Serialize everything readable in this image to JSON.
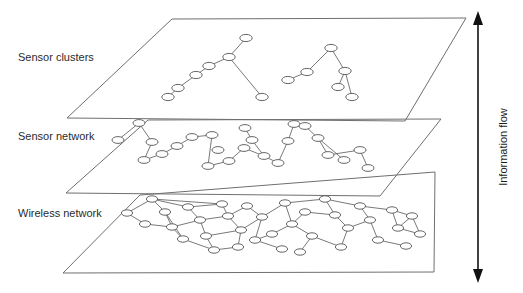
{
  "figure": {
    "type": "layered-network-diagram",
    "background_color": "#ffffff",
    "line_color": "#6a6a6a",
    "node_fill": "#ffffff",
    "text_color": "#2b2b2b",
    "layers": [
      {
        "id": "sensor-clusters",
        "label": "Sensor clusters",
        "label_x": 18,
        "label_y": 61,
        "plane": "172,19 466,18 405,121 67,118",
        "description": "two small cluster trees of sensor nodes"
      },
      {
        "id": "sensor-network",
        "label": "Sensor network",
        "label_x": 18,
        "label_y": 140,
        "plane": "148,120 441,119 380,196 66,193",
        "description": "sparse tree-like sensor network with hub nodes"
      },
      {
        "id": "wireless-network",
        "label": "Wireless network",
        "label_x": 18,
        "label_y": 217,
        "plane": "140,195 435,172 434,272 63,273",
        "description": "dense meshed wireless network"
      }
    ],
    "flow_arrow": {
      "label": "Information flow",
      "label_x": 505,
      "label_y": 146,
      "orientation": "vertical-double-headed",
      "x": 478,
      "y_top": 12,
      "y_bottom": 282
    },
    "clusters_nodes": [
      [
        246,
        38
      ],
      [
        229,
        57
      ],
      [
        209,
        66
      ],
      [
        196,
        75
      ],
      [
        178,
        88
      ],
      [
        168,
        97
      ],
      [
        262,
        97
      ],
      [
        331,
        48
      ],
      [
        307,
        72
      ],
      [
        288,
        80
      ],
      [
        345,
        71
      ],
      [
        338,
        87
      ],
      [
        352,
        97
      ]
    ],
    "clusters_links": [
      [
        246,
        38,
        229,
        57
      ],
      [
        229,
        57,
        209,
        66
      ],
      [
        209,
        66,
        196,
        75
      ],
      [
        196,
        75,
        178,
        88
      ],
      [
        178,
        88,
        168,
        97
      ],
      [
        229,
        57,
        262,
        97
      ],
      [
        331,
        48,
        307,
        72
      ],
      [
        307,
        72,
        288,
        80
      ],
      [
        331,
        48,
        345,
        71
      ],
      [
        345,
        71,
        338,
        87
      ],
      [
        345,
        71,
        352,
        97
      ]
    ],
    "sensor_nodes": [
      [
        139,
        123
      ],
      [
        118,
        140
      ],
      [
        152,
        142
      ],
      [
        144,
        160
      ],
      [
        162,
        154
      ],
      [
        177,
        146
      ],
      [
        192,
        137
      ],
      [
        212,
        135
      ],
      [
        218,
        150
      ],
      [
        208,
        166
      ],
      [
        229,
        161
      ],
      [
        244,
        148
      ],
      [
        245,
        128
      ],
      [
        252,
        140
      ],
      [
        264,
        156
      ],
      [
        278,
        163
      ],
      [
        288,
        141
      ],
      [
        294,
        124
      ],
      [
        305,
        126
      ],
      [
        318,
        138
      ],
      [
        328,
        155
      ],
      [
        344,
        160
      ],
      [
        360,
        150
      ],
      [
        368,
        168
      ]
    ],
    "sensor_links": [
      [
        139,
        123,
        118,
        140
      ],
      [
        139,
        123,
        152,
        142
      ],
      [
        152,
        142,
        144,
        160
      ],
      [
        144,
        160,
        162,
        154
      ],
      [
        162,
        154,
        177,
        146
      ],
      [
        177,
        146,
        192,
        137
      ],
      [
        192,
        137,
        212,
        135
      ],
      [
        212,
        135,
        208,
        166
      ],
      [
        208,
        166,
        229,
        161
      ],
      [
        229,
        161,
        244,
        148
      ],
      [
        244,
        148,
        264,
        156
      ],
      [
        264,
        156,
        278,
        163
      ],
      [
        245,
        128,
        252,
        140
      ],
      [
        252,
        140,
        264,
        156
      ],
      [
        294,
        124,
        305,
        126
      ],
      [
        305,
        126,
        318,
        138
      ],
      [
        318,
        138,
        328,
        155
      ],
      [
        318,
        138,
        344,
        160
      ],
      [
        328,
        155,
        360,
        150
      ],
      [
        360,
        150,
        368,
        168
      ],
      [
        288,
        141,
        278,
        163
      ],
      [
        288,
        141,
        294,
        124
      ]
    ],
    "wireless_nodes": [
      [
        152,
        199
      ],
      [
        127,
        213
      ],
      [
        165,
        212
      ],
      [
        172,
        227
      ],
      [
        145,
        224
      ],
      [
        188,
        207
      ],
      [
        200,
        220
      ],
      [
        183,
        239
      ],
      [
        206,
        236
      ],
      [
        222,
        204
      ],
      [
        228,
        216
      ],
      [
        241,
        230
      ],
      [
        247,
        206
      ],
      [
        262,
        217
      ],
      [
        255,
        240
      ],
      [
        272,
        234
      ],
      [
        238,
        247
      ],
      [
        214,
        250
      ],
      [
        285,
        203
      ],
      [
        292,
        224
      ],
      [
        305,
        212
      ],
      [
        312,
        236
      ],
      [
        282,
        249
      ],
      [
        300,
        252
      ],
      [
        325,
        199
      ],
      [
        335,
        215
      ],
      [
        348,
        228
      ],
      [
        341,
        247
      ],
      [
        360,
        206
      ],
      [
        370,
        220
      ],
      [
        378,
        240
      ],
      [
        392,
        210
      ],
      [
        398,
        228
      ],
      [
        406,
        246
      ],
      [
        412,
        216
      ],
      [
        420,
        234
      ]
    ],
    "wireless_links": [
      [
        152,
        199,
        127,
        213
      ],
      [
        152,
        199,
        165,
        212
      ],
      [
        152,
        199,
        188,
        207
      ],
      [
        127,
        213,
        145,
        224
      ],
      [
        145,
        224,
        172,
        227
      ],
      [
        165,
        212,
        172,
        227
      ],
      [
        165,
        212,
        183,
        239
      ],
      [
        172,
        227,
        200,
        220
      ],
      [
        172,
        227,
        183,
        239
      ],
      [
        183,
        239,
        214,
        250
      ],
      [
        188,
        207,
        200,
        220
      ],
      [
        188,
        207,
        222,
        204
      ],
      [
        200,
        220,
        206,
        236
      ],
      [
        200,
        220,
        228,
        216
      ],
      [
        206,
        236,
        214,
        250
      ],
      [
        206,
        236,
        241,
        230
      ],
      [
        222,
        204,
        228,
        216
      ],
      [
        228,
        216,
        241,
        230
      ],
      [
        228,
        216,
        247,
        206
      ],
      [
        241,
        230,
        238,
        247
      ],
      [
        241,
        230,
        262,
        217
      ],
      [
        247,
        206,
        262,
        217
      ],
      [
        262,
        217,
        255,
        240
      ],
      [
        262,
        217,
        285,
        203
      ],
      [
        255,
        240,
        272,
        234
      ],
      [
        255,
        240,
        282,
        249
      ],
      [
        272,
        234,
        292,
        224
      ],
      [
        285,
        203,
        292,
        224
      ],
      [
        285,
        203,
        325,
        199
      ],
      [
        292,
        224,
        305,
        212
      ],
      [
        292,
        224,
        312,
        236
      ],
      [
        305,
        212,
        335,
        215
      ],
      [
        312,
        236,
        300,
        252
      ],
      [
        312,
        236,
        341,
        247
      ],
      [
        325,
        199,
        335,
        215
      ],
      [
        335,
        215,
        348,
        228
      ],
      [
        348,
        228,
        341,
        247
      ],
      [
        348,
        228,
        370,
        220
      ],
      [
        360,
        206,
        370,
        220
      ],
      [
        360,
        206,
        392,
        210
      ],
      [
        370,
        220,
        378,
        240
      ],
      [
        378,
        240,
        406,
        246
      ],
      [
        392,
        210,
        398,
        228
      ],
      [
        398,
        228,
        412,
        216
      ],
      [
        398,
        228,
        420,
        234
      ],
      [
        412,
        216,
        420,
        234
      ],
      [
        325,
        199,
        360,
        206
      ],
      [
        238,
        247,
        214,
        250
      ],
      [
        152,
        199,
        222,
        204
      ],
      [
        392,
        210,
        412,
        216
      ]
    ]
  }
}
